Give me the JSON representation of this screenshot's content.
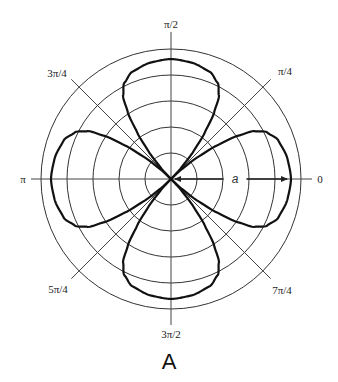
{
  "figure": {
    "caption": "A",
    "type": "polar-plot",
    "curve_description": "four-lobed rose-like curve with lobes along 0, π/2, π, 3π/2, pinched at origin along diagonals",
    "angle_labels": [
      {
        "angle_deg": 0,
        "text": "0"
      },
      {
        "angle_deg": 45,
        "text": "π/4"
      },
      {
        "angle_deg": 90,
        "text": "π/2"
      },
      {
        "angle_deg": 135,
        "text": "3π/4"
      },
      {
        "angle_deg": 180,
        "text": "π"
      },
      {
        "angle_deg": 225,
        "text": "5π/4"
      },
      {
        "angle_deg": 270,
        "text": "3π/2"
      },
      {
        "angle_deg": 315,
        "text": "7π/4"
      }
    ],
    "radius_marker_label": "a",
    "ring_count": 5,
    "lobe_angles_deg": [
      0,
      90,
      180,
      270
    ],
    "lobe_profile": {
      "note": "relative radius r/a versus angular offset from lobe axis (degrees)",
      "offset_deg": [
        0,
        10,
        20,
        26,
        30,
        33,
        36,
        39,
        42,
        45
      ],
      "r_over_a": [
        1.0,
        0.985,
        0.95,
        0.89,
        0.8,
        0.66,
        0.48,
        0.3,
        0.13,
        0.0
      ]
    },
    "colors": {
      "curve": "#111111",
      "grid": "#333333",
      "axis": "#444444",
      "background": "#ffffff"
    }
  }
}
